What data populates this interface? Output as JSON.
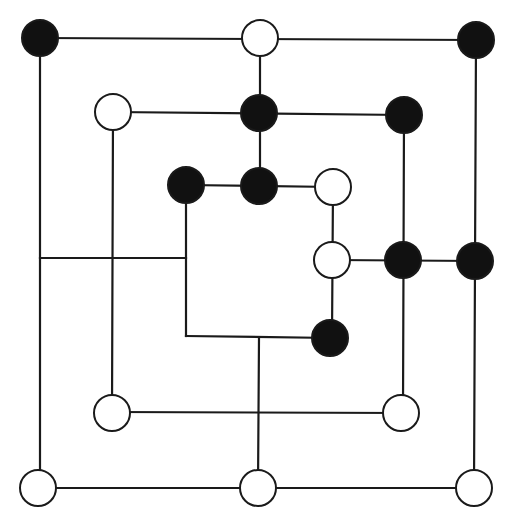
{
  "game": {
    "name": "Nine Men's Morris",
    "colors": {
      "black": "#111111",
      "white": "#ffffff",
      "line": "#1a1a1a",
      "background": "#ffffff"
    },
    "piece_radius": 18
  },
  "board": {
    "lines": [
      {
        "id": "outer-top",
        "x1": 40,
        "y1": 38,
        "x2": 476,
        "y2": 40
      },
      {
        "id": "outer-bottom",
        "x1": 40,
        "y1": 488,
        "x2": 476,
        "y2": 488
      },
      {
        "id": "outer-left",
        "x1": 40,
        "y1": 38,
        "x2": 40,
        "y2": 488
      },
      {
        "id": "outer-right",
        "x1": 476,
        "y1": 40,
        "x2": 474,
        "y2": 488
      },
      {
        "id": "middle-top",
        "x1": 113,
        "y1": 112,
        "x2": 404,
        "y2": 115
      },
      {
        "id": "middle-bottom",
        "x1": 112,
        "y1": 412,
        "x2": 403,
        "y2": 413
      },
      {
        "id": "middle-left",
        "x1": 113,
        "y1": 112,
        "x2": 112,
        "y2": 412
      },
      {
        "id": "middle-right",
        "x1": 404,
        "y1": 115,
        "x2": 403,
        "y2": 413
      },
      {
        "id": "inner-top",
        "x1": 186,
        "y1": 185,
        "x2": 333,
        "y2": 187
      },
      {
        "id": "inner-bottom",
        "x1": 186,
        "y1": 336,
        "x2": 332,
        "y2": 338
      },
      {
        "id": "inner-left",
        "x1": 186,
        "y1": 185,
        "x2": 186,
        "y2": 336
      },
      {
        "id": "inner-right",
        "x1": 333,
        "y1": 187,
        "x2": 332,
        "y2": 338
      },
      {
        "id": "top-spoke",
        "x1": 260,
        "y1": 38,
        "x2": 260,
        "y2": 185
      },
      {
        "id": "bottom-spoke",
        "x1": 259,
        "y1": 337,
        "x2": 258,
        "y2": 488
      },
      {
        "id": "left-spoke",
        "x1": 40,
        "y1": 258,
        "x2": 186,
        "y2": 258
      },
      {
        "id": "right-spoke",
        "x1": 333,
        "y1": 260,
        "x2": 476,
        "y2": 261
      }
    ],
    "points": [
      {
        "id": "outer-top-left",
        "x": 40,
        "y": 38,
        "piece": "black"
      },
      {
        "id": "outer-top-mid",
        "x": 260,
        "y": 38,
        "piece": "white"
      },
      {
        "id": "outer-top-right",
        "x": 476,
        "y": 40,
        "piece": "black"
      },
      {
        "id": "middle-top-left",
        "x": 113,
        "y": 112,
        "piece": "white"
      },
      {
        "id": "middle-top-mid",
        "x": 259,
        "y": 113,
        "piece": "black"
      },
      {
        "id": "middle-top-right",
        "x": 404,
        "y": 115,
        "piece": "black"
      },
      {
        "id": "inner-top-left",
        "x": 186,
        "y": 185,
        "piece": "black"
      },
      {
        "id": "inner-top-mid",
        "x": 259,
        "y": 186,
        "piece": "black"
      },
      {
        "id": "inner-top-right",
        "x": 333,
        "y": 187,
        "piece": "white"
      },
      {
        "id": "outer-mid-left",
        "x": 40,
        "y": 258,
        "piece": null
      },
      {
        "id": "middle-mid-left",
        "x": 113,
        "y": 258,
        "piece": null
      },
      {
        "id": "inner-mid-left",
        "x": 186,
        "y": 258,
        "piece": null
      },
      {
        "id": "inner-mid-right",
        "x": 332,
        "y": 260,
        "piece": "white"
      },
      {
        "id": "middle-mid-right",
        "x": 403,
        "y": 260,
        "piece": "black"
      },
      {
        "id": "outer-mid-right",
        "x": 475,
        "y": 261,
        "piece": "black"
      },
      {
        "id": "inner-bottom-left",
        "x": 186,
        "y": 336,
        "piece": null
      },
      {
        "id": "inner-bottom-mid",
        "x": 259,
        "y": 337,
        "piece": null
      },
      {
        "id": "inner-bottom-right",
        "x": 330,
        "y": 338,
        "piece": "black"
      },
      {
        "id": "middle-bottom-left",
        "x": 112,
        "y": 413,
        "piece": "white"
      },
      {
        "id": "middle-bottom-mid",
        "x": 258,
        "y": 413,
        "piece": null
      },
      {
        "id": "middle-bottom-right",
        "x": 401,
        "y": 413,
        "piece": "white"
      },
      {
        "id": "outer-bottom-left",
        "x": 38,
        "y": 488,
        "piece": "white"
      },
      {
        "id": "outer-bottom-mid",
        "x": 258,
        "y": 488,
        "piece": "white"
      },
      {
        "id": "outer-bottom-right",
        "x": 474,
        "y": 488,
        "piece": "white"
      }
    ]
  },
  "counts": {
    "black_pieces": 9,
    "white_pieces": 9
  }
}
